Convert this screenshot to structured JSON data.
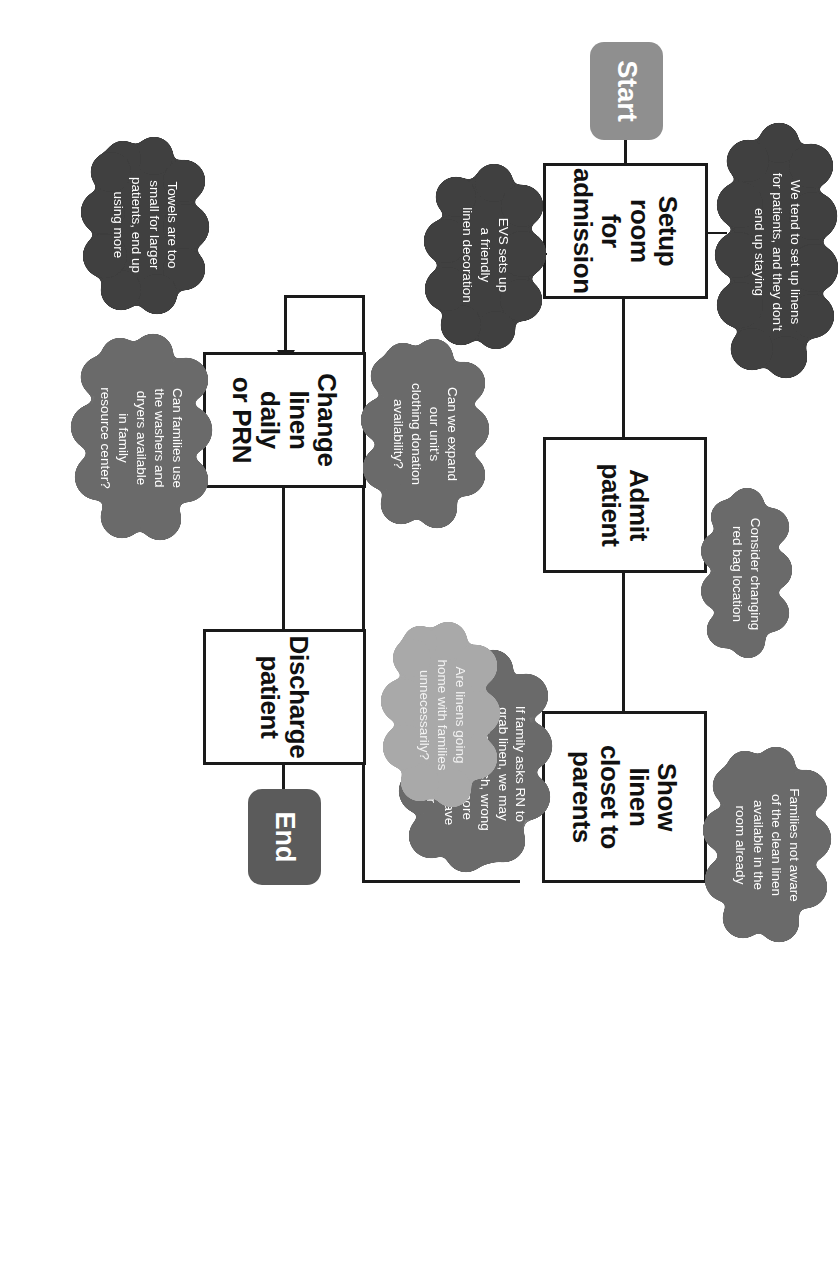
{
  "diagram": {
    "orientation": "rotated-90-clockwise",
    "colors": {
      "process_fill": "#ffffff",
      "process_border": "#1a1a1a",
      "start_fill": "#8f8f8f",
      "end_fill": "#5b5b5b",
      "cloud_mid": "#6b6b6b",
      "cloud_dark": "#3f3f3f",
      "cloud_light": "#a9a9a9"
    },
    "nodes": [
      {
        "id": "start",
        "type": "terminator",
        "label": "Start"
      },
      {
        "id": "setup",
        "type": "process",
        "label": "Setup\nroom\nfor\nadmission"
      },
      {
        "id": "admit",
        "type": "process",
        "label": "Admit\npatient"
      },
      {
        "id": "show",
        "type": "process",
        "label": "Show\nlinen\ncloset to\nparents"
      },
      {
        "id": "change",
        "type": "process",
        "label": "Change\nlinen\ndaily\nor PRN"
      },
      {
        "id": "discharge",
        "type": "process",
        "label": "Discharge\npatient"
      },
      {
        "id": "end",
        "type": "terminator",
        "label": "End"
      }
    ],
    "clouds": [
      {
        "id": "c-evs",
        "shade": "dark",
        "attached_to": "setup",
        "text": "EVS sets up\na friendly\nlinen decoration"
      },
      {
        "id": "c-setlinens",
        "shade": "dark",
        "attached_to": "setup",
        "text": "We tend to set up linens\nfor patients, and they don't\nend up staying"
      },
      {
        "id": "c-redbag",
        "shade": "mid",
        "attached_to": "admit",
        "text": "Consider changing\nred bag location"
      },
      {
        "id": "c-grablinen",
        "shade": "mid",
        "attached_to": "show",
        "text": "If family asks RN to\ngrab linen, we may\nbring too much, wrong\nsize, or bring more\nthan needed to save\nus a trip later"
      },
      {
        "id": "c-notaware",
        "shade": "mid",
        "attached_to": "show",
        "text": "Families not aware\nof the clean linen\navailable in the\nroom already"
      },
      {
        "id": "c-donation",
        "shade": "mid",
        "attached_to": "change",
        "text": "Can we expand\nour unit's\nclothing donation\navailability?"
      },
      {
        "id": "c-washers",
        "shade": "mid",
        "attached_to": "change",
        "text": "Can families use\nthe washers and\ndryers available\nin family\nresource center?"
      },
      {
        "id": "c-towels",
        "shade": "dark",
        "attached_to": "change",
        "text": "Towels are too\nsmall for larger\npatients, end up\nusing more"
      },
      {
        "id": "c-gohome",
        "shade": "light",
        "attached_to": "discharge",
        "text": "Are linens going\nhome with families\nunnecessarily?"
      }
    ],
    "edges": [
      {
        "from": "setup",
        "to": "admit"
      },
      {
        "from": "admit",
        "to": "show"
      },
      {
        "from": "show",
        "to": "change"
      },
      {
        "from": "change",
        "to": "discharge"
      },
      {
        "from": "discharge",
        "to": "end"
      },
      {
        "from": "start",
        "to": "setup"
      }
    ]
  }
}
